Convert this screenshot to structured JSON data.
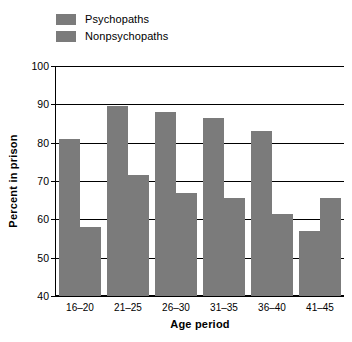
{
  "chart_data": {
    "type": "bar",
    "title": "",
    "xlabel": "Age period",
    "ylabel": "Percent in prison",
    "categories": [
      "16–20",
      "21–25",
      "26–30",
      "31–35",
      "36–40",
      "41–45"
    ],
    "series": [
      {
        "name": "Psychopaths",
        "color": "#7b7b7b",
        "values": [
          81,
          89.5,
          88,
          86.5,
          83,
          57
        ]
      },
      {
        "name": "Nonpsychopaths",
        "color": "#7b7b7b",
        "values": [
          58,
          71.5,
          67,
          65.5,
          61.5,
          65.5
        ]
      }
    ],
    "ylim": [
      40,
      100
    ],
    "yticks": [
      40,
      50,
      60,
      70,
      80,
      90,
      100
    ],
    "ytick_labels": [
      "40",
      "50",
      "60",
      "70",
      "80",
      "90",
      "100"
    ],
    "grid": true,
    "grid_axis": "y",
    "legend_position": "top-left",
    "bar_color": "#7b7b7b",
    "axis_color": "#000000",
    "background": "#ffffff"
  },
  "legend": {
    "items": [
      {
        "label": "Psychopaths"
      },
      {
        "label": "Nonpsychopaths"
      }
    ]
  }
}
